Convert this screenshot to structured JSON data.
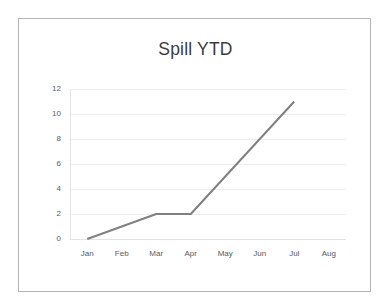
{
  "chart_data": {
    "type": "line",
    "title": "Spill YTD",
    "xlabel": "",
    "ylabel": "",
    "categories": [
      "Jan",
      "Feb",
      "Mar",
      "Apr",
      "May",
      "Jun",
      "Jul",
      "Aug"
    ],
    "series": [
      {
        "name": "Spill YTD",
        "values": [
          0,
          1,
          2,
          2,
          5,
          8,
          11,
          null
        ],
        "color": "#808080"
      }
    ],
    "y_ticks": [
      0,
      2,
      4,
      6,
      8,
      10,
      12
    ],
    "y_tick_labels": [
      "0",
      "2",
      "4",
      "6",
      "8",
      "10",
      "12"
    ],
    "ylim": [
      0,
      12
    ],
    "grid": "horizontal",
    "legend": "none",
    "markers": "none",
    "annotations": []
  },
  "frame": {
    "border_color": "#b4b4b4",
    "background_color": "#ffffff"
  },
  "style": {
    "title_color": "#3c3c3c",
    "tick_label_color": "#5a5a5a",
    "gridline_color": "#ededed",
    "axis_color": "#e4e4e4"
  }
}
